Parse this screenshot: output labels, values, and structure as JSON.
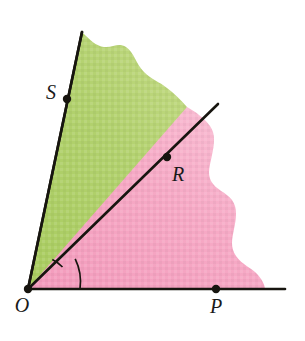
{
  "figure": {
    "name": "angle-diagram-two-shaded-regions",
    "background_color": "#ffffff",
    "width": 305,
    "height": 341,
    "line_color": "#17150f",
    "line_width": 2.6,
    "point_radius": 4.2
  },
  "colors": {
    "green_region": "#b0d06a",
    "green_region_light": "#c5dd8c",
    "pink_region": "#f6a6c2",
    "pink_region_light": "#f9bed3",
    "stroke": "#17150f",
    "label": "#1a1a1a"
  },
  "points": [
    {
      "id": "O",
      "label": "O",
      "x": 28,
      "y": 289,
      "label_x": 22,
      "label_y": 312,
      "anchor": "middle"
    },
    {
      "id": "P",
      "label": "P",
      "x": 216,
      "y": 289,
      "label_x": 216,
      "label_y": 313,
      "anchor": "middle"
    },
    {
      "id": "R",
      "label": "R",
      "x": 167,
      "y": 157,
      "label_x": 178,
      "label_y": 181,
      "anchor": "middle"
    },
    {
      "id": "S",
      "label": "S",
      "x": 67,
      "y": 99,
      "label_x": 51,
      "label_y": 99,
      "anchor": "middle"
    }
  ],
  "rays": [
    {
      "id": "ray-OS",
      "from": "O",
      "through": "S",
      "x1": 28,
      "y1": 289,
      "x2": 82,
      "y2": 32
    },
    {
      "id": "ray-OR",
      "from": "O",
      "through": "R",
      "x1": 28,
      "y1": 289,
      "x2": 218,
      "y2": 104
    },
    {
      "id": "ray-OP",
      "from": "O",
      "through": "P",
      "x1": 28,
      "y1": 289,
      "x2": 285,
      "y2": 289
    }
  ],
  "angle_arcs": [
    {
      "id": "arc-SOR",
      "between": "OS and OR",
      "radius": 38,
      "path": "M 52.3 259.6 A 38 38 0 0 1 62.5 267.0"
    },
    {
      "id": "arc-ROP",
      "between": "OR and OP",
      "radius": 52,
      "path": "M 75.2 258.9 A 52 52 0 0 1 80.0 289.0"
    }
  ],
  "regions": [
    {
      "id": "green-region",
      "name": "angle-SOR-shaded-green",
      "fill": "#b0d06a",
      "bounded_by": [
        "ray-OS",
        "ray-OR"
      ],
      "outer_edge": "wavy",
      "path": "M 28 289 L 82 32 C 90 40 96 46 104 47 C 113 48 118 42 126 47 C 134 52 136 64 144 72 C 152 80 160 82 167 88 C 175 94 181 100 187 107 L 167 157 Z"
    },
    {
      "id": "pink-region",
      "name": "angle-ROP-shaded-pink",
      "fill": "#f6a6c2",
      "bounded_by": [
        "ray-OR",
        "ray-OP"
      ],
      "outer_edge": "wavy",
      "path": "M 28 289 L 187 107 C 196 112 204 118 210 126 C 216 134 214 145 212 155 C 210 165 207 173 211 181 C 216 190 226 192 232 200 C 238 208 236 219 234 229 C 232 239 230 247 236 256 C 242 265 252 268 258 275 C 263 281 265 286 265 289 Z"
    }
  ],
  "notes": {
    "texture": "subtle paper grain over both shaded regions"
  }
}
